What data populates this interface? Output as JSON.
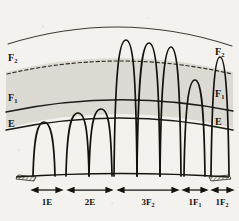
{
  "figure": {
    "type": "ionospheric-propagation-diagram",
    "background_color": "#f4f2ee",
    "ink_color": "#1a1713",
    "shading_color": "#d9d6cf",
    "layer_labels_left": [
      {
        "name": "F2-label-left",
        "text": "F",
        "sub": "2"
      },
      {
        "name": "F1-label-left",
        "text": "F",
        "sub": "1"
      },
      {
        "name": "E-label-left",
        "text": "E",
        "sub": ""
      }
    ],
    "layer_labels_right": [
      {
        "name": "F2-label-right",
        "text": "F",
        "sub": "2"
      },
      {
        "name": "F1-label-right",
        "text": "F",
        "sub": "1"
      },
      {
        "name": "E-label-right",
        "text": "E",
        "sub": ""
      }
    ],
    "arcs": [
      {
        "name": "top-arc",
        "label": "",
        "style": "solid",
        "apex_y": 16
      },
      {
        "name": "f2-arc",
        "label": "F2",
        "style": "dashed",
        "apex_y": 60
      },
      {
        "name": "f1-arc",
        "label": "F1",
        "style": "solid",
        "apex_y": 99
      },
      {
        "name": "e-arc",
        "label": "E",
        "style": "solid",
        "apex_y": 119
      }
    ],
    "hops": [
      {
        "name": "hop-1E-a",
        "mode": "E",
        "peak_height": 122
      },
      {
        "name": "hop-2E-a",
        "mode": "E",
        "peak_height": 112
      },
      {
        "name": "hop-2E-b",
        "mode": "E",
        "peak_height": 108
      },
      {
        "name": "hop-3F2-a",
        "mode": "F2",
        "peak_height": 39
      },
      {
        "name": "hop-3F2-b",
        "mode": "F2",
        "peak_height": 42
      },
      {
        "name": "hop-3F2-c",
        "mode": "F2",
        "peak_height": 47
      },
      {
        "name": "hop-1F1-a",
        "mode": "F1",
        "peak_height": 79
      },
      {
        "name": "hop-1F2-a",
        "mode": "F2",
        "peak_height": 56
      }
    ],
    "ground": {
      "name": "ground-line",
      "left_terminal": "hatched-pad",
      "right_terminal": "hatched-pad"
    },
    "span_markers": [
      {
        "name": "span-1E",
        "text": "1E",
        "sub": "",
        "x1": 32,
        "x2": 62
      },
      {
        "name": "span-2E",
        "text": "2E",
        "sub": "",
        "x1": 68,
        "x2": 112
      },
      {
        "name": "span-3F2",
        "text": "3F",
        "sub": "2",
        "x1": 118,
        "x2": 178
      },
      {
        "name": "span-1F1",
        "text": "1F",
        "sub": "1",
        "x1": 183,
        "x2": 207
      },
      {
        "name": "span-1F2",
        "text": "1F",
        "sub": "2",
        "x1": 212,
        "x2": 233
      }
    ]
  }
}
